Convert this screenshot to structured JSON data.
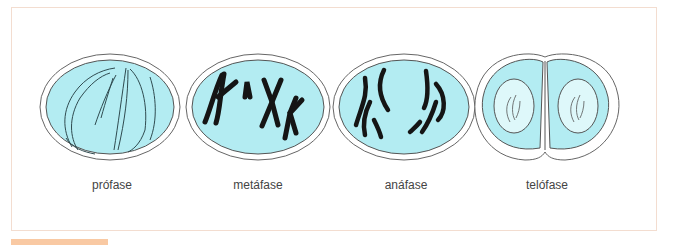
{
  "figure": {
    "colors": {
      "cytoplasm": "#b3ecf2",
      "nucleus_telophase": "#def8fa",
      "membrane": "#555555",
      "chromosome": "#1a1a1a",
      "frame_border": "#f3ddd0",
      "accent_tab": "#f9c9a3"
    },
    "phases": [
      {
        "label": "prófase",
        "cx": 110,
        "cy": 107
      },
      {
        "label": "metáfase",
        "cx": 258,
        "cy": 107
      },
      {
        "label": "anáfase",
        "cx": 404,
        "cy": 107
      },
      {
        "label": "telófase",
        "cx": 545,
        "cy": 107
      }
    ]
  }
}
